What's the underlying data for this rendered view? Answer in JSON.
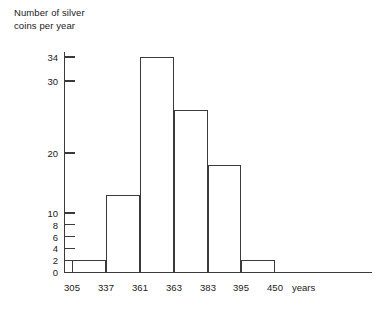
{
  "chart_data": {
    "type": "bar",
    "title": "Number of silver\ncoins per year",
    "xlabel": "years",
    "ylabel": "Number of silver coins per year",
    "bin_edges": [
      305,
      337,
      361,
      363,
      383,
      395,
      450
    ],
    "categories": [
      "305-337",
      "337-361",
      "361-363",
      "363-383",
      "383-395",
      "395-450"
    ],
    "values": [
      2,
      13,
      34,
      26,
      18,
      2
    ],
    "x_tick_labels": [
      "305",
      "337",
      "361",
      "363",
      "383",
      "395",
      "450"
    ],
    "y_tick_labels": [
      "0",
      "2",
      "4",
      "6",
      "8",
      "10",
      "20",
      "30",
      "34"
    ],
    "y_tick_values": [
      0,
      2,
      4,
      6,
      8,
      10,
      20,
      30,
      34
    ],
    "ylim": [
      0,
      34
    ],
    "grid": false,
    "legend": "none",
    "bar_fill": "#ffffff",
    "bar_stroke": "#3a3a3a",
    "axis_color": "#3a3a3a",
    "background": "#ffffff"
  },
  "footer": {
    "text": ""
  }
}
